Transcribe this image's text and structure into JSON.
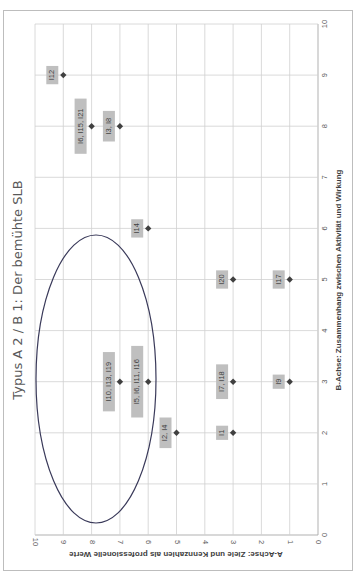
{
  "chart_data": {
    "type": "scatter",
    "title": "Typus A 2 / B 1: Der bemühte  SLB",
    "xlabel": "A-Achse: Ziele und Kennzahlen als professionelle Werte",
    "ylabel": "B-Achse: Zusammenhang zwischen Aktivität und Wirkung",
    "xlim": [
      0,
      10
    ],
    "ylim": [
      0,
      10
    ],
    "x_ticks": [
      "0",
      "1",
      "2",
      "3",
      "4",
      "5",
      "6",
      "7",
      "8",
      "9",
      "10"
    ],
    "y_ticks": [
      "0",
      "1",
      "2",
      "3",
      "4",
      "5",
      "6",
      "7",
      "8",
      "9",
      "10"
    ],
    "grid": true,
    "orientation_note": "figure rotated 90° clockwise on the page",
    "points": [
      {
        "label": "I12",
        "a": 9,
        "b": 9
      },
      {
        "label": "I6, I15, I21",
        "a": 8,
        "b": 8
      },
      {
        "label": "I3, I8",
        "a": 7,
        "b": 8
      },
      {
        "label": "I14",
        "a": 6,
        "b": 6
      },
      {
        "label": "I20",
        "a": 3,
        "b": 5
      },
      {
        "label": "I17",
        "a": 1,
        "b": 5
      },
      {
        "label": "I10, I13, I19",
        "a": 7,
        "b": 3
      },
      {
        "label": "I5, I6, I11, I16",
        "a": 6,
        "b": 3
      },
      {
        "label": "I7, I18",
        "a": 3,
        "b": 3
      },
      {
        "label": "I9",
        "a": 1,
        "b": 3
      },
      {
        "label": "I2, I4",
        "a": 5,
        "b": 2
      },
      {
        "label": "I1",
        "a": 3,
        "b": 2
      }
    ],
    "annotations": [
      {
        "type": "ellipse",
        "description": "highlight cluster around A 6–10, B 1–6"
      }
    ]
  }
}
